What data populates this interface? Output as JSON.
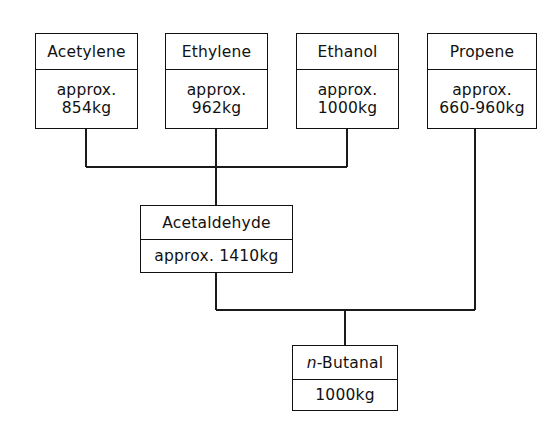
{
  "diagram": {
    "type": "process-flow",
    "nodes": [
      {
        "id": "acetylene",
        "title": "Acetylene",
        "value_lines": [
          "approx.",
          "854kg"
        ],
        "role": "feedstock"
      },
      {
        "id": "ethylene",
        "title": "Ethylene",
        "value_lines": [
          "approx.",
          "962kg"
        ],
        "role": "feedstock"
      },
      {
        "id": "ethanol",
        "title": "Ethanol",
        "value_lines": [
          "approx.",
          "1000kg"
        ],
        "role": "feedstock"
      },
      {
        "id": "propene",
        "title": "Propene",
        "value_lines": [
          "approx.",
          "660-960kg"
        ],
        "role": "feedstock"
      },
      {
        "id": "acetaldehyde",
        "title": "Acetaldehyde",
        "value_lines": [
          "approx. 1410kg"
        ],
        "role": "intermediate"
      },
      {
        "id": "butanal",
        "title_prefix": "n",
        "title_suffix": "-Butanal",
        "value_lines": [
          "1000kg"
        ],
        "role": "product"
      }
    ],
    "edges": [
      {
        "from": "acetylene",
        "to": "acetaldehyde"
      },
      {
        "from": "ethylene",
        "to": "acetaldehyde"
      },
      {
        "from": "ethanol",
        "to": "acetaldehyde"
      },
      {
        "from": "acetaldehyde",
        "to": "butanal"
      },
      {
        "from": "propene",
        "to": "butanal"
      }
    ],
    "colors": {
      "line": "#1a1a1a",
      "border": "#111111",
      "text": "#111111",
      "background": "#ffffff"
    }
  }
}
